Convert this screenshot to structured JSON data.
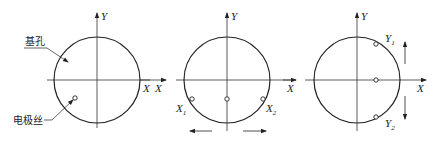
{
  "diagram": {
    "colors": {
      "stroke": "#222222",
      "axis": "#333333",
      "background": "#ffffff"
    },
    "panels": [
      {
        "id": "panel-1",
        "axis_x_label": "X",
        "axis_y_label": "Y",
        "callouts": [
          {
            "label": "基孔"
          },
          {
            "label": "电极丝"
          }
        ]
      },
      {
        "id": "panel-2",
        "axis_x_label": "X",
        "axis_y_label": "Y",
        "left_axis_label": "X",
        "points": [
          {
            "label": "X",
            "sub": "1"
          },
          {
            "label": "X",
            "sub": "2"
          }
        ]
      },
      {
        "id": "panel-3",
        "axis_x_label": "X",
        "axis_y_label": "Y",
        "left_axis_label": "X",
        "points": [
          {
            "label": "Y",
            "sub": "1"
          },
          {
            "label": "Y",
            "sub": "2"
          }
        ]
      }
    ]
  }
}
